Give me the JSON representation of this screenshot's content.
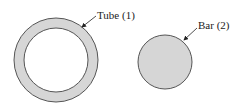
{
  "diagram": {
    "tube": {
      "label": "Tube (1)",
      "center": [
        56,
        60
      ],
      "outer_radius": 42,
      "inner_radius": 32,
      "fill": "#d6d6d6",
      "stroke": "#555555"
    },
    "bar": {
      "label": "Bar (2)",
      "center": [
        165,
        62
      ],
      "radius": 27,
      "fill": "#d6d6d6",
      "stroke": "#555555"
    }
  }
}
